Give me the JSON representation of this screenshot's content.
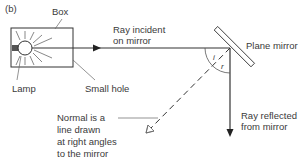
{
  "figure": {
    "panel_label": "(b)",
    "labels": {
      "box": "Box",
      "lamp": "Lamp",
      "small_hole": "Small hole",
      "incident_ray": [
        "Ray incident",
        "on mirror"
      ],
      "plane_mirror": "Plane mirror",
      "reflected_ray": [
        "Ray reflected",
        "from mirror"
      ],
      "normal": [
        "Normal is a",
        "line drawn",
        "at right angles",
        "to the mirror"
      ],
      "angle_incidence": "i",
      "angle_reflection": "r"
    },
    "colors": {
      "line": "#333333",
      "background": "#ffffff"
    }
  }
}
